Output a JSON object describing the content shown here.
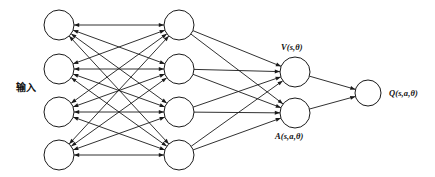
{
  "diagram": {
    "type": "neural-network-diagram",
    "background_color": "#ffffff",
    "stroke_color": "#1a1a1a",
    "node_fill": "#ffffff",
    "node_radius": 15,
    "output_node_radius": 13,
    "labels": {
      "input": "输入",
      "value_stream": "V(s,θ)",
      "advantage_stream": "A(s,a,θ)",
      "output": "Q(s,a,θ)"
    },
    "layers": [
      {
        "name": "input-layer",
        "node_count": 4,
        "x": 59,
        "node_y": [
          25,
          69,
          112,
          155
        ],
        "radius": 15
      },
      {
        "name": "hidden-layer",
        "node_count": 4,
        "x": 179,
        "node_y": [
          25,
          69,
          112,
          155
        ],
        "radius": 15
      },
      {
        "name": "stream-layer",
        "node_count": 2,
        "x": 295,
        "node_y": [
          72,
          113
        ],
        "radius": 15
      },
      {
        "name": "output-layer",
        "node_count": 1,
        "x": 368,
        "node_y": [
          93
        ],
        "radius": 13
      }
    ],
    "connections": [
      {
        "from": "input-layer",
        "to": "hidden-layer",
        "style": "fully-connected",
        "arrow": "both"
      },
      {
        "from": "hidden-layer",
        "to": "stream-layer",
        "style": "fully-connected",
        "arrow": "forward"
      },
      {
        "from": "stream-layer",
        "to": "output-layer",
        "style": "fully-connected",
        "arrow": "forward"
      }
    ]
  }
}
